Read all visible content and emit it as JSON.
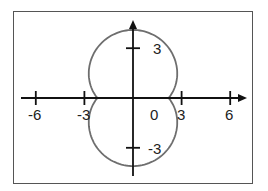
{
  "chart_data": {
    "type": "line",
    "subtype": "polar-curve",
    "title": "",
    "xlabel": "",
    "ylabel": "",
    "xlim": [
      -7,
      7
    ],
    "ylim": [
      -4.6,
      4.6
    ],
    "grid": false,
    "legend": null,
    "x_ticks": [
      -6,
      -3,
      3,
      6
    ],
    "x_tick_labels": [
      "-6",
      "-3",
      "3",
      "6"
    ],
    "y_ticks": [
      3,
      -3
    ],
    "y_tick_labels": [
      "3",
      "-3"
    ],
    "origin_label": "0",
    "curve_description": "closed polar curve approx r = 2.2 + 1.9|sin θ|; crosses x-axis at ±2.2, reaches y = ±4.1, widest ≈ ±2.75 near y = ±1.6",
    "series": [
      {
        "name": "polar curve",
        "points": [
          [
            2.2,
            0
          ],
          [
            2.66,
            0.63
          ],
          [
            2.73,
            1.58
          ],
          [
            2.4,
            2.62
          ],
          [
            1.35,
            3.72
          ],
          [
            0,
            4.1
          ],
          [
            -1.35,
            3.72
          ],
          [
            -2.4,
            2.62
          ],
          [
            -2.73,
            1.58
          ],
          [
            -2.66,
            0.63
          ],
          [
            -2.2,
            0
          ],
          [
            -2.66,
            -0.63
          ],
          [
            -2.73,
            -1.58
          ],
          [
            -2.4,
            -2.62
          ],
          [
            -1.35,
            -3.72
          ],
          [
            0,
            -4.1
          ],
          [
            1.35,
            -3.72
          ],
          [
            2.4,
            -2.62
          ],
          [
            2.73,
            -1.58
          ],
          [
            2.66,
            -0.63
          ],
          [
            2.2,
            0
          ]
        ],
        "color": "#6e6e6e"
      }
    ],
    "axis_color": "#111111",
    "frame_color": "#555555"
  },
  "labels": {
    "x_neg6": "-6",
    "x_neg3": "-3",
    "origin": "0",
    "x_pos3": "3",
    "x_pos6": "6",
    "y_pos3": "3",
    "y_neg3": "-3"
  }
}
